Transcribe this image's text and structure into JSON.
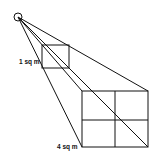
{
  "diagram": {
    "type": "inverse-square-law",
    "labels": {
      "small_area": "1 sq m",
      "large_area": "4 sq m"
    },
    "colors": {
      "line": "#111111",
      "background": "#ffffff"
    }
  }
}
